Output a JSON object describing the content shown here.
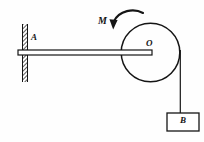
{
  "figure": {
    "background_color": "#fefefe",
    "stroke_color": "#151515",
    "labels": {
      "support_point": "A",
      "pulley_center": "O",
      "moment": "M",
      "block": "B"
    },
    "icons": {
      "wall": "hatched-wall-icon",
      "rod": "horizontal-rod-icon",
      "pulley": "pulley-circle-icon",
      "moment_arrow": "curved-moment-arrow-icon",
      "rope": "vertical-rope-icon",
      "block": "block-rectangle-icon"
    },
    "geometry": {
      "wall_x": 22,
      "wall_top": 24,
      "wall_bottom": 82,
      "wall_width": 6,
      "rod_left": 18,
      "rod_right": 152,
      "rod_top": 50,
      "rod_height": 5,
      "pulley_cx": 150.5,
      "pulley_cy": 52.5,
      "pulley_r": 29.5,
      "rope_x": 180.5,
      "rope_top": 50,
      "rope_bottom": 113,
      "block_x": 167,
      "block_y": 113,
      "block_w": 32,
      "block_h": 18
    }
  }
}
